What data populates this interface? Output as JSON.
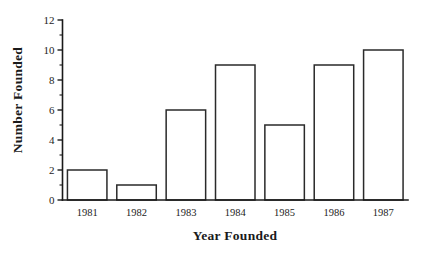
{
  "chart_data": {
    "type": "bar",
    "title": "",
    "xlabel": "Year Founded",
    "ylabel": "Number Founded",
    "categories": [
      "1981",
      "1982",
      "1983",
      "1984",
      "1985",
      "1986",
      "1987"
    ],
    "values": [
      2,
      1,
      6,
      9,
      5,
      9,
      10
    ],
    "ylim": [
      0,
      12
    ],
    "ytick_labels": [
      "0",
      "2",
      "4",
      "6",
      "8",
      "10",
      "12"
    ],
    "ytick_values": [
      0,
      2,
      4,
      6,
      8,
      10,
      12
    ],
    "yminor_ticks": [
      1,
      3,
      5,
      7,
      9,
      11
    ],
    "grid": false,
    "legend": null,
    "bar_style": {
      "face_color": "#ffffff",
      "edge_color": "#2a2a2a",
      "hatch": "diagonal-forward-slash",
      "hatch_color": "#555555"
    },
    "axes_style": {
      "top_spine": false,
      "right_spine": false,
      "axis_color": "#1a1a1a"
    }
  },
  "figure": {
    "background_color": "#ffffff"
  }
}
